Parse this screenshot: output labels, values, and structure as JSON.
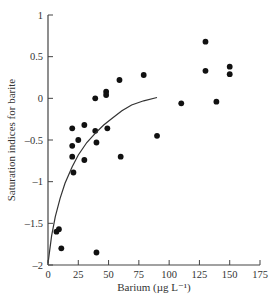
{
  "chart_data": {
    "type": "scatter",
    "title": "",
    "xlabel": "Barium (µg L⁻¹)",
    "ylabel": "Saturation indices for barite",
    "xlim": [
      0,
      175
    ],
    "ylim": [
      -2,
      1
    ],
    "x_ticks": [
      0,
      25,
      50,
      75,
      100,
      125,
      150,
      175
    ],
    "x_tick_labels": [
      "0",
      "25",
      "50",
      "75",
      "100",
      "125",
      "150",
      "175"
    ],
    "y_ticks": [
      1,
      0.5,
      0,
      -0.5,
      -1,
      -1.5,
      -2
    ],
    "y_tick_labels": [
      "1",
      "0.5",
      "0",
      "–0.5",
      "–1",
      "–1.5",
      "–2"
    ],
    "grid": false,
    "legend": null,
    "series": [
      {
        "name": "observations",
        "kind": "points",
        "color": "#111111",
        "points": [
          {
            "x": 7,
            "y": -1.6
          },
          {
            "x": 9,
            "y": -1.57
          },
          {
            "x": 11,
            "y": -1.8
          },
          {
            "x": 20,
            "y": -0.36
          },
          {
            "x": 20,
            "y": -0.57
          },
          {
            "x": 20,
            "y": -0.7
          },
          {
            "x": 21,
            "y": -0.89
          },
          {
            "x": 25,
            "y": -0.5
          },
          {
            "x": 30,
            "y": -0.32
          },
          {
            "x": 30,
            "y": -0.74
          },
          {
            "x": 39,
            "y": -0.39
          },
          {
            "x": 39,
            "y": 0.0
          },
          {
            "x": 40,
            "y": -0.53
          },
          {
            "x": 40,
            "y": -1.85
          },
          {
            "x": 48,
            "y": 0.08
          },
          {
            "x": 48,
            "y": 0.04
          },
          {
            "x": 49,
            "y": -0.36
          },
          {
            "x": 59,
            "y": 0.22
          },
          {
            "x": 60,
            "y": -0.7
          },
          {
            "x": 79,
            "y": 0.28
          },
          {
            "x": 90,
            "y": -0.45
          },
          {
            "x": 110,
            "y": -0.06
          },
          {
            "x": 130,
            "y": 0.68
          },
          {
            "x": 130,
            "y": 0.33
          },
          {
            "x": 139,
            "y": -0.04
          },
          {
            "x": 150,
            "y": 0.38
          },
          {
            "x": 150,
            "y": 0.29
          }
        ]
      },
      {
        "name": "fitted curve",
        "kind": "line",
        "color": "#333333",
        "points": [
          {
            "x": 0,
            "y": -1.98
          },
          {
            "x": 3,
            "y": -1.65
          },
          {
            "x": 6,
            "y": -1.42
          },
          {
            "x": 10,
            "y": -1.2
          },
          {
            "x": 14,
            "y": -1.02
          },
          {
            "x": 20,
            "y": -0.82
          },
          {
            "x": 25,
            "y": -0.68
          },
          {
            "x": 32,
            "y": -0.53
          },
          {
            "x": 39,
            "y": -0.42
          },
          {
            "x": 46,
            "y": -0.32
          },
          {
            "x": 53,
            "y": -0.24
          },
          {
            "x": 61,
            "y": -0.15
          },
          {
            "x": 69,
            "y": -0.08
          },
          {
            "x": 79,
            "y": -0.03
          },
          {
            "x": 90,
            "y": 0.01
          }
        ]
      }
    ]
  }
}
